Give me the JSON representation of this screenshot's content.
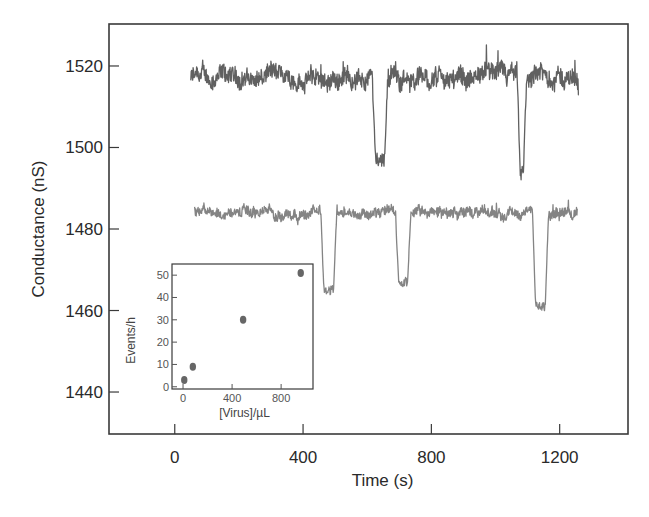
{
  "chart_data": [
    {
      "type": "line",
      "title": "",
      "xlabel": "Time (s)",
      "ylabel": "Conductance (nS)",
      "xlim": [
        -205,
        1413
      ],
      "ylim": [
        1429.7,
        1530.3
      ],
      "xticks": [
        0,
        400,
        800,
        1200
      ],
      "yticks": [
        1440,
        1460,
        1480,
        1500,
        1520
      ],
      "xtick_labels": [
        "0",
        "400",
        "800",
        "1200"
      ],
      "ytick_labels": [
        "1440",
        "1460",
        "1480",
        "1500",
        "1520"
      ],
      "grid": false,
      "legend": null,
      "series": [
        {
          "name": "upper-trace",
          "color": "#444444",
          "t_start": 50,
          "t_end": 1260,
          "baseline": 1517,
          "noise_amplitude": 2.5,
          "events": [
            {
              "time": 640,
              "duration": 28,
              "depth": 1497
            },
            {
              "time": 1082,
              "duration": 10,
              "depth": 1494
            }
          ]
        },
        {
          "name": "lower-trace",
          "color": "#6e6e6e",
          "t_start": 62,
          "t_end": 1255,
          "baseline": 1484,
          "noise_amplitude": 1.4,
          "events": [
            {
              "time": 480,
              "duration": 30,
              "depth": 1465
            },
            {
              "time": 712,
              "duration": 28,
              "depth": 1467
            },
            {
              "time": 1140,
              "duration": 30,
              "depth": 1461
            }
          ]
        }
      ]
    },
    {
      "type": "scatter",
      "title": "",
      "xlabel": "[Virus]/µL",
      "ylabel": "Events/h",
      "xlim": [
        -90,
        1060
      ],
      "ylim": [
        -1,
        55
      ],
      "xticks": [
        0,
        400,
        800
      ],
      "yticks": [
        0,
        10,
        20,
        30,
        40,
        50
      ],
      "xtick_labels": [
        "0",
        "400",
        "800"
      ],
      "ytick_labels": [
        "0",
        "10",
        "20",
        "30",
        "40",
        "50"
      ],
      "grid": false,
      "legend": null,
      "x": [
        10,
        80,
        490,
        960
      ],
      "y": [
        3,
        9,
        30,
        51
      ],
      "marker_color": "#555555"
    }
  ]
}
